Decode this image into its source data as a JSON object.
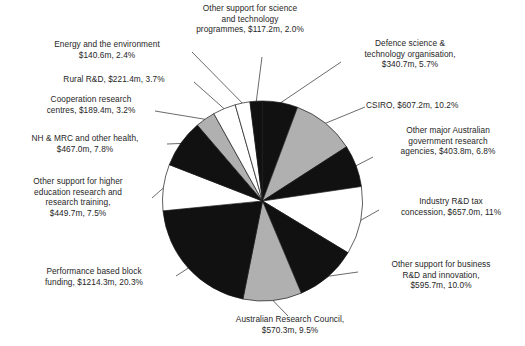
{
  "chart_data": {
    "type": "pie",
    "title": "",
    "subtitle": "",
    "xlabel": "",
    "ylabel": "",
    "legend_position": "none",
    "grid": false,
    "value_unit": "$ million",
    "total_value": 5974.2,
    "categories": [
      "Defence science & technology organisation",
      "CSIRO",
      "Other major Australian government research agencies",
      "Industry R&D tax concession",
      "Other support for business R&D and innovation",
      "Australian Research Council",
      "Performance based block funding",
      "Other support for higher education research and research training",
      "NH & MRC and other health",
      "Cooperation research centres",
      "Rural R&D",
      "Energy and the environment",
      "Other support for science and technology programmes"
    ],
    "values": [
      340.7,
      607.2,
      403.8,
      657.0,
      595.7,
      570.3,
      1214.3,
      449.7,
      467.0,
      189.4,
      221.4,
      140.6,
      117.2
    ],
    "percentages": [
      5.7,
      10.2,
      6.8,
      11.0,
      10.0,
      9.5,
      20.3,
      7.5,
      7.8,
      3.2,
      3.7,
      2.4,
      2.0
    ],
    "slice_fills": [
      "#111111",
      "#b0b0b0",
      "#111111",
      "#ffffff",
      "#111111",
      "#b0b0b0",
      "#111111",
      "#ffffff",
      "#111111",
      "#b0b0b0",
      "#ffffff",
      "#ffffff",
      "#111111"
    ],
    "start_angle_deg": 0,
    "direction": "clockwise"
  },
  "labels": {
    "science_tech_programmes": "Other support for science\nand technology\nprogrammes, $117.2m, 2.0%",
    "defence": "Defence science &\ntechnology organisation,\n$340.7m, 5.7%",
    "csiro": "CSIRO, $607.2m, 10.2%",
    "other_major_agencies": "Other major Australian\ngovernment research\nagencies, $403.8m, 6.8%",
    "industry_tax": "Industry R&D tax\nconcession, $657.0m, 11%",
    "business_rnd": "Other support for business\nR&D and innovation,\n$595.7m, 10.0%",
    "arc": "Australian Research Council,\n$570.3m, 9.5%",
    "block_funding": "Performance based block\nfunding, $1214.3m, 20.3%",
    "higher_education": "Other support for higher\neducation research and\nresearch training,\n$449.7m, 7.5%",
    "nhmrc": "NH & MRC and other health,\n$467.0m, 7.8%",
    "cooperation_centres": "Cooperation research\ncentres, $189.4m, 3.2%",
    "rural_rnd": "Rural R&D, $221.4m, 3.7%",
    "energy_environment": "Energy and the environment\n$140.6m, 2.4%"
  },
  "colors": {
    "slice_dark": "#111111",
    "slice_gray": "#b0b0b0",
    "slice_light": "#ffffff",
    "outline": "#1a1a1a",
    "text": "#262626",
    "background": "#ffffff"
  }
}
